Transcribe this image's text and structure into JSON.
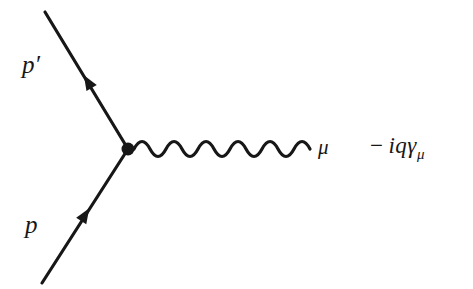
{
  "figure": {
    "type": "feynman-diagram",
    "background_color": "#ffffff",
    "ink_color": "#171717",
    "width": 473,
    "height": 289
  },
  "labels": {
    "incoming_fermion": "p",
    "outgoing_fermion": "p′",
    "outgoing_fermion_base": "p",
    "outgoing_fermion_prime": "′",
    "photon_index": "μ",
    "amplitude_minus": "−",
    "amplitude_body": "iqγ",
    "amplitude_subscript": "μ",
    "amplitude_full": "− iqγμ"
  },
  "geometry": {
    "vertex": {
      "x": 128,
      "y": 149,
      "radius": 6
    },
    "incoming_fermion_line": {
      "x1": 42,
      "y1": 283,
      "x2": 128,
      "y2": 149
    },
    "outgoing_fermion_line": {
      "x1": 128,
      "y1": 149,
      "x2": 45,
      "y2": 12
    },
    "incoming_arrow": {
      "x": 85,
      "y": 215,
      "direction": "up-right"
    },
    "outgoing_arrow": {
      "x": 88,
      "y": 82,
      "direction": "up-left"
    },
    "photon_line": {
      "x_start": 134,
      "x_end": 310,
      "y_center": 149,
      "amplitude": 9,
      "cycles": 5.5
    },
    "stroke_width": 3.2
  }
}
